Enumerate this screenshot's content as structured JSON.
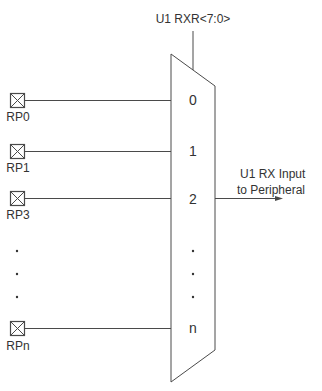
{
  "diagram": {
    "control": {
      "label": "U1 RXR<7:0>"
    },
    "output": {
      "line1": "U1 RX Input",
      "line2": "to Peripheral"
    },
    "pins": [
      {
        "label": "RP0",
        "mux_input": "0"
      },
      {
        "label": "RP1",
        "mux_input": "1"
      },
      {
        "label": "RP3",
        "mux_input": "2"
      },
      {
        "label": "RPn",
        "mux_input": "n"
      }
    ],
    "ellipsis": "·",
    "colors": {
      "stroke": "#4a4a4a",
      "text": "#333333",
      "background": "#ffffff"
    }
  }
}
